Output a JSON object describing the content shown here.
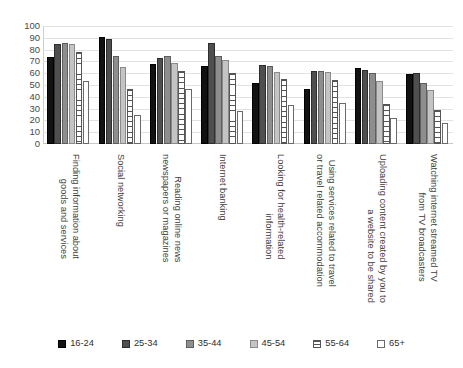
{
  "chart_data": {
    "type": "bar",
    "title": "",
    "subtitle": "",
    "xlabel": "",
    "ylabel": "",
    "ylim": [
      0,
      100
    ],
    "ytick_step": 10,
    "yticks": [
      100,
      90,
      80,
      70,
      60,
      50,
      40,
      30,
      20,
      10,
      0
    ],
    "grid": true,
    "legend_position": "bottom",
    "grouping": "clustered",
    "categories": [
      "Finding information about goods and services",
      "Social networking",
      "Reading online news newspapers or magazines",
      "Internet banking",
      "Looking for health-related information",
      "Using services related to travel or travel related accommodation",
      "Uploading content created by you to a website to be shared",
      "Watching internet streamed TV from TV broadcasters"
    ],
    "category_lines": [
      [
        "Finding information about",
        "goods and services"
      ],
      [
        "Social networking"
      ],
      [
        "Reading online news",
        "newspapers or magazines"
      ],
      [
        "Internet banking"
      ],
      [
        "Looking for health-related",
        "information"
      ],
      [
        "Using services related to travel",
        "or travel related accommodation"
      ],
      [
        "Uploading content created by you to",
        "a website to be shared"
      ],
      [
        "Watching internet streamed TV",
        "from TV broadcasters"
      ]
    ],
    "series": [
      {
        "name": "16-24",
        "color": "#121212",
        "pattern": "solid",
        "values": [
          74,
          91,
          68,
          66,
          52,
          47,
          64,
          59
        ]
      },
      {
        "name": "25-34",
        "color": "#4f4f4f",
        "pattern": "solid",
        "values": [
          85,
          89,
          73,
          86,
          67,
          62,
          63,
          60
        ]
      },
      {
        "name": "35-44",
        "color": "#8e8e8e",
        "pattern": "solid",
        "values": [
          86,
          75,
          75,
          75,
          66,
          62,
          60,
          52
        ]
      },
      {
        "name": "45-54",
        "color": "#c4c4c4",
        "pattern": "solid",
        "values": [
          85,
          65,
          69,
          71,
          61,
          61,
          53,
          46
        ]
      },
      {
        "name": "55-64",
        "color": "#ffffff",
        "pattern": "horizontal",
        "values": [
          78,
          47,
          62,
          60,
          55,
          54,
          34,
          29
        ]
      },
      {
        "name": "65+",
        "color": "#ffffff",
        "pattern": "none",
        "values": [
          53,
          25,
          47,
          28,
          33,
          35,
          22,
          18
        ]
      }
    ]
  }
}
